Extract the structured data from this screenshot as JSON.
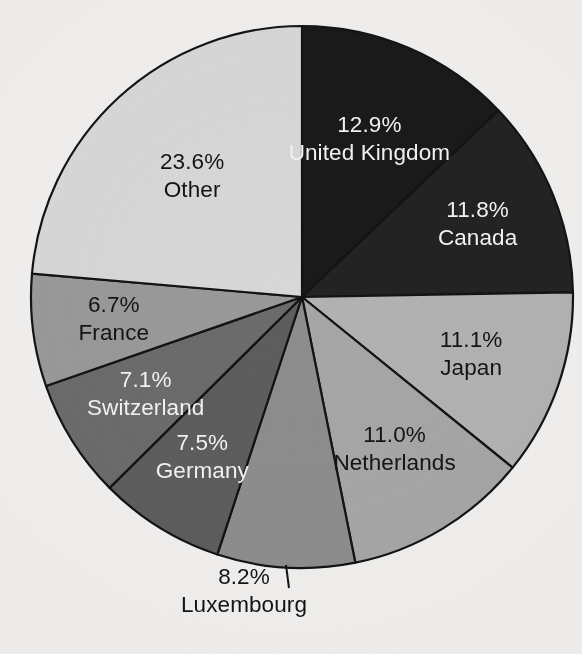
{
  "chart_data": {
    "type": "pie",
    "title": "",
    "subtitle": "",
    "xlabel": "",
    "ylabel": "",
    "legend_position": "none",
    "grid": false,
    "value_unit": "percent",
    "start_angle_deg": 0,
    "direction": "clockwise",
    "categories": [
      "United Kingdom",
      "Canada",
      "Japan",
      "Netherlands",
      "Luxembourg",
      "Germany",
      "Switzerland",
      "France",
      "Other"
    ],
    "values": [
      12.9,
      11.8,
      11.1,
      11.0,
      8.2,
      7.5,
      7.1,
      6.7,
      23.6
    ],
    "slices": [
      {
        "label": "United Kingdom",
        "value": 12.9,
        "value_text": "12.9%",
        "fill": "#1a1a1a",
        "text_color": "#f4f4f2",
        "label_placement": "inside"
      },
      {
        "label": "Canada",
        "value": 11.8,
        "value_text": "11.8%",
        "fill": "#232323",
        "text_color": "#f4f4f2",
        "label_placement": "inside"
      },
      {
        "label": "Japan",
        "value": 11.1,
        "value_text": "11.1%",
        "fill": "#b3b3b3",
        "text_color": "#141414",
        "label_placement": "inside"
      },
      {
        "label": "Netherlands",
        "value": 11.0,
        "value_text": "11.0%",
        "fill": "#a7a7a7",
        "text_color": "#141414",
        "label_placement": "inside"
      },
      {
        "label": "Luxembourg",
        "value": 8.2,
        "value_text": "8.2%",
        "fill": "#8e8e8e",
        "text_color": "#141414",
        "label_placement": "outside"
      },
      {
        "label": "Germany",
        "value": 7.5,
        "value_text": "7.5%",
        "fill": "#5e5e5e",
        "text_color": "#f4f4f2",
        "label_placement": "inside"
      },
      {
        "label": "Switzerland",
        "value": 7.1,
        "value_text": "7.1%",
        "fill": "#6c6c6c",
        "text_color": "#f4f4f2",
        "label_placement": "inside"
      },
      {
        "label": "France",
        "value": 6.7,
        "value_text": "6.7%",
        "fill": "#9a9a9a",
        "text_color": "#141414",
        "label_placement": "inside"
      },
      {
        "label": "Other",
        "value": 23.6,
        "value_text": "23.6%",
        "fill": "#d9d9d9",
        "text_color": "#141414",
        "label_placement": "inside"
      }
    ]
  },
  "style": {
    "background": "#f2f1ef",
    "outline": "#141414",
    "center_x": 302,
    "center_y": 297,
    "radius": 271
  }
}
